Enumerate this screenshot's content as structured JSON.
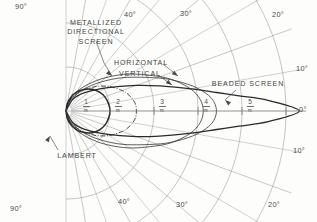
{
  "figure": {
    "type": "polar-goniophotometric-diagram",
    "title_visible": false
  },
  "curve_labels": {
    "metallized": "METALLIZED\nDIRECTIONAL\nSCREEN",
    "metallized_line1": "METALLIZED",
    "metallized_line2": "DIRECTIONAL",
    "metallized_line3": "SCREEN",
    "horizontal": "HORIZONTAL",
    "vertical": "VERTICAL",
    "beaded": "BEADED SCREEN",
    "lambert": "LAMBERT"
  },
  "angle_labels": {
    "top": [
      {
        "text": "90°",
        "value": 90
      },
      {
        "text": "40°",
        "value": 40
      },
      {
        "text": "30°",
        "value": 30
      },
      {
        "text": "20°",
        "value": 20
      },
      {
        "text": "10°",
        "value": 10
      }
    ],
    "right": [
      {
        "text": "0°",
        "value": 0
      }
    ],
    "bottom": [
      {
        "text": "90°",
        "value": -90
      },
      {
        "text": "40°",
        "value": -40
      },
      {
        "text": "30°",
        "value": -30
      },
      {
        "text": "20°",
        "value": -20
      },
      {
        "text": "10°",
        "value": -10
      }
    ]
  },
  "radial_ticks": [
    {
      "num": "1",
      "den": "π",
      "value": 1
    },
    {
      "num": "2",
      "den": "π",
      "value": 2
    },
    {
      "num": "3",
      "den": "π",
      "value": 3
    },
    {
      "num": "4",
      "den": "π",
      "value": 4
    },
    {
      "num": "5",
      "den": "π",
      "value": 5
    }
  ],
  "colors": {
    "ink": "#3a3a3a",
    "grid": "#8c8c8c",
    "curve": "#2b2b2b",
    "paper": "#fdfdfc"
  },
  "chart_data": {
    "type": "line",
    "coordinate_system": "polar",
    "title": "",
    "xlabel": "",
    "ylabel": "",
    "angle_unit": "degrees",
    "angle_range": [
      -90,
      90
    ],
    "radial_unit": "candela per lumen (1/π units)",
    "radial_range": [
      0,
      5.6
    ],
    "grid": true,
    "legend_position": "inline-annotations",
    "gridlines": {
      "radial_rays_deg": [
        -90,
        -80,
        -70,
        -60,
        -50,
        -40,
        -30,
        -20,
        -10,
        0,
        10,
        20,
        30,
        40,
        50,
        60,
        70,
        80,
        90
      ],
      "arcs_radius": [
        1,
        2,
        3,
        4,
        5
      ]
    },
    "series": [
      {
        "name": "LAMBERT",
        "note": "perfect diffuser, gain 1; circle tangent at origin",
        "angles": [
          -90,
          -80,
          -70,
          -60,
          -50,
          -40,
          -30,
          -20,
          -10,
          0,
          10,
          20,
          30,
          40,
          50,
          60,
          70,
          80,
          90
        ],
        "values": [
          0,
          0.17,
          0.34,
          0.5,
          0.64,
          0.77,
          0.87,
          0.94,
          0.98,
          1.0,
          0.98,
          0.94,
          0.87,
          0.77,
          0.64,
          0.5,
          0.34,
          0.17,
          0
        ]
      },
      {
        "name": "METALLIZED DIRECTIONAL SCREEN",
        "angles": [
          -90,
          -70,
          -60,
          -50,
          -40,
          -30,
          -20,
          -15,
          -10,
          -5,
          0,
          5,
          10,
          15,
          20,
          30,
          40,
          50,
          60,
          70,
          90
        ],
        "values": [
          0,
          0.25,
          0.42,
          0.62,
          0.86,
          1.12,
          1.36,
          1.46,
          1.54,
          1.59,
          1.6,
          1.59,
          1.54,
          1.46,
          1.36,
          1.12,
          0.86,
          0.62,
          0.42,
          0.25,
          0
        ]
      },
      {
        "name": "HORIZONTAL",
        "angles": [
          -90,
          -70,
          -60,
          -50,
          -40,
          -30,
          -20,
          -15,
          -10,
          -5,
          0,
          5,
          10,
          15,
          20,
          30,
          40,
          50,
          60,
          70,
          90
        ],
        "values": [
          0,
          0.3,
          0.52,
          0.8,
          1.18,
          1.68,
          2.28,
          2.6,
          2.88,
          3.06,
          3.12,
          3.06,
          2.88,
          2.6,
          2.28,
          1.68,
          1.18,
          0.8,
          0.52,
          0.3,
          0
        ]
      },
      {
        "name": "VERTICAL",
        "angles": [
          -90,
          -70,
          -60,
          -50,
          -40,
          -30,
          -20,
          -15,
          -10,
          -5,
          0,
          5,
          10,
          15,
          20,
          30,
          40,
          50,
          60,
          70,
          90
        ],
        "values": [
          0,
          0.22,
          0.4,
          0.66,
          1.02,
          1.52,
          2.2,
          2.62,
          3.02,
          3.32,
          3.42,
          3.32,
          3.02,
          2.62,
          2.2,
          1.52,
          1.02,
          0.66,
          0.4,
          0.22,
          0
        ]
      },
      {
        "name": "BEADED SCREEN",
        "angles": [
          -90,
          -60,
          -45,
          -30,
          -20,
          -15,
          -10,
          -7,
          -5,
          -3,
          0,
          3,
          5,
          7,
          10,
          15,
          20,
          30,
          45,
          60,
          90
        ],
        "values": [
          0,
          0.3,
          0.58,
          1.05,
          1.7,
          2.2,
          2.9,
          3.45,
          3.95,
          4.6,
          5.3,
          4.6,
          3.95,
          3.45,
          2.9,
          2.2,
          1.7,
          1.05,
          0.58,
          0.3,
          0
        ]
      }
    ]
  }
}
